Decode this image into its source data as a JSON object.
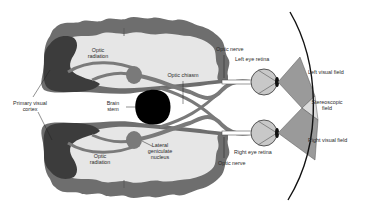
{
  "colors": {
    "cortex_outer": "#6e6e6e",
    "primary_visual_cortex": "#3c3c3c",
    "white_matter": "#e6e6e6",
    "tracts": "#7a7a7a",
    "brain_stem": "#000000",
    "eye_fill": "#c8c8c8",
    "visual_field": "#9a9a9a",
    "stereoscopic_field": "#dcdcdc"
  },
  "labels": {
    "optic_radiation_top": [
      "Optic",
      "radiation"
    ],
    "optic_radiation_bottom": [
      "Optic",
      "radiation"
    ],
    "primary_visual_cortex": [
      "Primary visual",
      "cortex"
    ],
    "brain_stem": [
      "Brain",
      "stem"
    ],
    "optic_chiasm": "Optic chiasm",
    "lateral_geniculate_nucleus": [
      "Lateral",
      "geniculate",
      "nucleus"
    ],
    "optic_nerve_top": "Optic nerve",
    "optic_nerve_bottom": "Optic nerve",
    "left_eye_retina": "Left eye retina",
    "right_eye_retina": "Right eye retina",
    "left_visual_field": "Left visual field",
    "stereoscopic_field": [
      "Stereoscopic",
      "field"
    ],
    "right_visual_field": "Right visual field"
  }
}
